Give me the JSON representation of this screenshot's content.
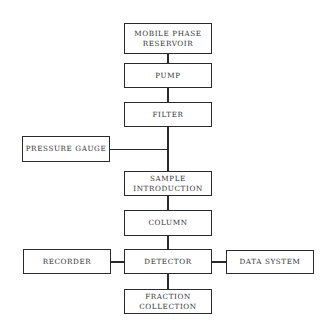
{
  "diagram": {
    "nodes": [
      {
        "id": "mobile_phase_reservoir",
        "label": "MOBILE PHASE\nRESERVOIR"
      },
      {
        "id": "pump",
        "label": "PUMP"
      },
      {
        "id": "filter",
        "label": "FILTER"
      },
      {
        "id": "pressure_gauge",
        "label": "PRESSURE GAUGE"
      },
      {
        "id": "sample_introduction",
        "label": "SAMPLE\nINTRODUCTION"
      },
      {
        "id": "column",
        "label": "COLUMN"
      },
      {
        "id": "recorder",
        "label": "RECORDER"
      },
      {
        "id": "detector",
        "label": "DETECTOR"
      },
      {
        "id": "data_system",
        "label": "DATA SYSTEM"
      },
      {
        "id": "fraction_collection",
        "label": "FRACTION\nCOLLECTION"
      }
    ],
    "edges": [
      [
        "mobile_phase_reservoir",
        "pump"
      ],
      [
        "pump",
        "filter"
      ],
      [
        "filter",
        "sample_introduction"
      ],
      [
        "pressure_gauge",
        "filter-sample line"
      ],
      [
        "sample_introduction",
        "column"
      ],
      [
        "column",
        "detector"
      ],
      [
        "recorder",
        "detector"
      ],
      [
        "detector",
        "data_system"
      ],
      [
        "detector",
        "fraction_collection"
      ]
    ]
  }
}
